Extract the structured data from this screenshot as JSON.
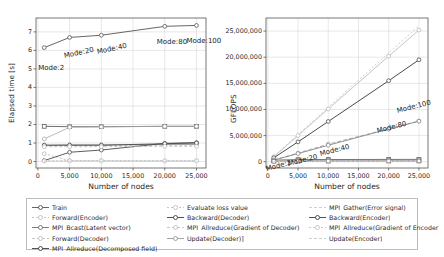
{
  "figure": {
    "background": "#ffffff",
    "frame_color": "#555555",
    "grid_color": "#d9d9d9"
  },
  "chart_data": [
    {
      "type": "line",
      "panel": "left",
      "title": "",
      "xlabel": "Number of nodes",
      "ylabel": "Elapsed time [s]",
      "xlim": [
        -300,
        26500
      ],
      "ylim": [
        -0.35,
        7.75
      ],
      "xticks": [
        0,
        5000,
        10000,
        15000,
        20000,
        25000
      ],
      "xticklabels": [
        "0",
        "5,000",
        "10,000",
        "15,000",
        "20,000",
        "25,000"
      ],
      "yticks": [
        0,
        1,
        2,
        3,
        4,
        5,
        6,
        7
      ],
      "yticklabels": [
        "0",
        "1",
        "2",
        "3",
        "4",
        "5",
        "6",
        "7"
      ],
      "grid": true,
      "legend_position": "below-figure",
      "x": [
        1000,
        5000,
        10000,
        20000,
        25000
      ],
      "annotations": [
        {
          "text": "Mode:2",
          "x": 1000,
          "y": 6.15,
          "dx": -6,
          "dy": 16,
          "rotation": 0
        },
        {
          "text": "Mode:20",
          "x": 5000,
          "y": 6.7,
          "dx": -6,
          "dy": 15,
          "rotation": -12
        },
        {
          "text": "Mode:40",
          "x": 10000,
          "y": 6.8,
          "dx": -4,
          "dy": 12,
          "rotation": -12
        },
        {
          "text": "Mode:80",
          "x": 20000,
          "y": 7.3,
          "dx": -8,
          "dy": 12,
          "rotation": 0
        },
        {
          "text": "Mode:100",
          "x": 25000,
          "y": 7.35,
          "dx": -10,
          "dy": 12,
          "rotation": 0
        }
      ],
      "series": [
        {
          "name": "Train",
          "values": [
            6.15,
            6.7,
            6.82,
            7.3,
            7.35
          ],
          "color": "#555555",
          "dash": "none",
          "marker": "o",
          "width": 0.9
        },
        {
          "name": "Forward(Encoder)",
          "values": [
            0.42,
            0.05,
            0.05,
            0.04,
            0.04
          ],
          "color": "#b5b5b5",
          "dash": "2,2",
          "marker": "o",
          "width": 0.8
        },
        {
          "name": "MPI_Bcast(Latent vector)",
          "values": [
            0.88,
            0.9,
            0.9,
            0.92,
            0.92
          ],
          "color": "#8a8a8a",
          "dash": "none",
          "marker": "o",
          "width": 0.8
        },
        {
          "name": "Forward(Decoder)",
          "values": [
            0.85,
            0.86,
            0.86,
            0.88,
            0.88
          ],
          "color": "#b5b5b5",
          "dash": "3,2",
          "marker": "o",
          "width": 0.8
        },
        {
          "name": "MPI_Allreduce(Decomposed field)",
          "values": [
            1.9,
            1.88,
            1.88,
            1.9,
            1.9
          ],
          "color": "#5d5d5d",
          "dash": "none",
          "marker": "s",
          "width": 0.9
        },
        {
          "name": "Evaluate loss value",
          "values": [
            0.04,
            0.04,
            0.04,
            0.04,
            0.04
          ],
          "color": "#c2c2c2",
          "dash": "2,2",
          "marker": "o",
          "width": 0.8
        },
        {
          "name": "Backward(Decoder)",
          "values": [
            0.05,
            0.5,
            0.62,
            0.98,
            1.02
          ],
          "color": "#4a4a4a",
          "dash": "none",
          "marker": "o",
          "width": 0.9
        },
        {
          "name": "MPI_Allreduce(Gradient of Decoder)",
          "values": [
            1.22,
            1.85,
            1.87,
            1.9,
            1.9
          ],
          "color": "#a8a8a8",
          "dash": "none",
          "marker": "o",
          "width": 0.8
        },
        {
          "name": "Update(Decoder)]",
          "values": [
            0.03,
            0.03,
            0.03,
            0.03,
            0.03
          ],
          "color": "#c9c9c9",
          "dash": "2,2",
          "marker": "o",
          "width": 0.8
        },
        {
          "name": "MPI_Gather(Error signal)",
          "values": [
            0.02,
            0.02,
            0.02,
            0.02,
            0.02
          ],
          "color": "#cfcfcf",
          "dash": "none",
          "marker": "none",
          "width": 0.7
        },
        {
          "name": "Backward(Encoder)",
          "values": [
            0.88,
            0.88,
            0.88,
            0.96,
            1.0
          ],
          "color": "#4a4a4a",
          "dash": "none",
          "marker": "o",
          "width": 0.9
        },
        {
          "name": "MPI_Allreduce(Gradient of Encoder)",
          "values": [
            0.8,
            0.8,
            0.8,
            0.82,
            0.82
          ],
          "color": "#bbbbbb",
          "dash": "3,2",
          "marker": "o",
          "width": 0.8
        },
        {
          "name": "Update(Encoder)",
          "values": [
            0.01,
            0.01,
            0.01,
            0.01,
            0.01
          ],
          "color": "#d2d2d2",
          "dash": "2,2",
          "marker": "none",
          "width": 0.7
        }
      ]
    },
    {
      "type": "line",
      "panel": "right",
      "title": "",
      "xlabel": "Number of nodes",
      "ylabel": "GFLOPS",
      "xlim": [
        -300,
        26500
      ],
      "ylim": [
        -1200000,
        27500000
      ],
      "xticks": [
        0,
        5000,
        10000,
        15000,
        20000,
        25000
      ],
      "xticklabels": [
        "0",
        "5,000",
        "10,000",
        "15,000",
        "20,000",
        "25,000"
      ],
      "yticks": [
        0,
        5000000,
        10000000,
        15000000,
        20000000,
        25000000
      ],
      "yticklabels": [
        "0",
        "5,000,000",
        "10,000,000",
        "15,000,000",
        "20,000,000",
        "25,000,000"
      ],
      "grid": true,
      "legend_position": "below-figure",
      "x": [
        1000,
        5000,
        10000,
        20000,
        25000
      ],
      "annotations": [
        {
          "text": "Mode:2",
          "x": 1000,
          "y": 600000,
          "dx": -8,
          "dy": 6,
          "rotation": -14
        },
        {
          "text": "Mode:20",
          "x": 5000,
          "y": 1800000,
          "dx": -10,
          "dy": 8,
          "rotation": -14
        },
        {
          "text": "Mode:40",
          "x": 10000,
          "y": 3400000,
          "dx": -8,
          "dy": 6,
          "rotation": -14
        },
        {
          "text": "Mode:80",
          "x": 20000,
          "y": 6300000,
          "dx": -12,
          "dy": -2,
          "rotation": -14
        },
        {
          "text": "Mode:100",
          "x": 25000,
          "y": 7800000,
          "dx": -22,
          "dy": -14,
          "rotation": -14
        }
      ],
      "series": [
        {
          "name": "Train",
          "values": [
            300000,
            400000,
            420000,
            440000,
            450000
          ],
          "color": "#5d5d5d",
          "dash": "none",
          "marker": "s",
          "width": 0.9
        },
        {
          "name": "Forward(Encoder)",
          "values": [
            1000000,
            5200000,
            10400000,
            20800000,
            26000000
          ],
          "color": "#cacaca",
          "dash": "2,2",
          "marker": "none",
          "width": 0.9
        },
        {
          "name": "MPI_Bcast(Latent vector)",
          "values": [
            950000,
            5000000,
            10100000,
            20200000,
            25200000
          ],
          "color": "#bcbcbc",
          "dash": "none",
          "marker": "o",
          "width": 0.9
        },
        {
          "name": "Forward(Decoder)",
          "values": [
            760000,
            3800000,
            7700000,
            15500000,
            19500000
          ],
          "color": "#4a4a4a",
          "dash": "none",
          "marker": "o",
          "width": 1.0
        },
        {
          "name": "MPI_Allreduce(Decomposed field)",
          "values": [
            200000,
            250000,
            280000,
            300000,
            320000
          ],
          "color": "#8f8f8f",
          "dash": "none",
          "marker": "s",
          "width": 0.8
        },
        {
          "name": "Evaluate loss value",
          "values": [
            330000,
            1650000,
            3350000,
            6300000,
            7800000
          ],
          "color": "#a0a0a0",
          "dash": "4,2",
          "marker": "o",
          "width": 0.9
        },
        {
          "name": "Backward(Decoder)",
          "values": [
            310000,
            1560000,
            3150000,
            6250000,
            7750000
          ],
          "color": "#8a8a8a",
          "dash": "none",
          "marker": "o",
          "width": 0.9
        },
        {
          "name": "MPI_Allreduce(Gradient of Decoder)",
          "values": [
            150000,
            180000,
            200000,
            220000,
            230000
          ],
          "color": "#c4c4c4",
          "dash": "none",
          "marker": "none",
          "width": 0.7
        },
        {
          "name": "Update(Decoder)]",
          "values": [
            120000,
            150000,
            160000,
            170000,
            180000
          ],
          "color": "#cccccc",
          "dash": "2,2",
          "marker": "none",
          "width": 0.7
        },
        {
          "name": "MPI_Gather(Error signal)",
          "values": [
            100000,
            120000,
            130000,
            140000,
            150000
          ],
          "color": "#d4d4d4",
          "dash": "none",
          "marker": "none",
          "width": 0.7
        },
        {
          "name": "Backward(Encoder)",
          "values": [
            90000,
            110000,
            120000,
            130000,
            140000
          ],
          "color": "#6e6e6e",
          "dash": "none",
          "marker": "s",
          "width": 0.8
        },
        {
          "name": "MPI_Allreduce(Gradient of Encoder)",
          "values": [
            80000,
            100000,
            110000,
            120000,
            130000
          ],
          "color": "#cfcfcf",
          "dash": "3,2",
          "marker": "none",
          "width": 0.7
        },
        {
          "name": "Update(Encoder)",
          "values": [
            70000,
            90000,
            100000,
            110000,
            120000
          ],
          "color": "#d8d8d8",
          "dash": "2,2",
          "marker": "none",
          "width": 0.7
        }
      ]
    }
  ],
  "legend": {
    "columns": [
      [
        {
          "label": "Train",
          "color": "#555555",
          "dash": "none",
          "marker": "o"
        },
        {
          "label": "Forward(Encoder)",
          "color": "#bdbdbd",
          "dash": "2,2",
          "marker": "o"
        },
        {
          "label": "MPI_Bcast(Latent vector)",
          "color": "#6f6f6f",
          "dash": "none",
          "marker": "o"
        },
        {
          "label": "Forward(Decoder)",
          "color": "#bdbdbd",
          "dash": "3,2",
          "marker": "o"
        },
        {
          "label": "MPI_Allreduce(Decomposed field)",
          "color": "#3d3d3d",
          "dash": "none",
          "marker": "o"
        }
      ],
      [
        {
          "label": "Evaluate loss value",
          "color": "#c0c0c0",
          "dash": "2,2",
          "marker": "o"
        },
        {
          "label": "Backward(Decoder)",
          "color": "#3d3d3d",
          "dash": "none",
          "marker": "o"
        },
        {
          "label": "MPI_Allreduce(Gradient of Decoder)",
          "color": "#c0c0c0",
          "dash": "3,2",
          "marker": "o"
        },
        {
          "label": "Update(Decoder)]",
          "color": "#9a9a9a",
          "dash": "none",
          "marker": "o"
        }
      ],
      [
        {
          "label": "MPI_Gather(Error signal)",
          "color": "#cacaca",
          "dash": "3,2",
          "marker": "none"
        },
        {
          "label": "Backward(Encoder)",
          "color": "#3d3d3d",
          "dash": "none",
          "marker": "o"
        },
        {
          "label": "MPI_Allreduce(Gradient of Encoder)",
          "color": "#c0c0c0",
          "dash": "2,2",
          "marker": "o"
        },
        {
          "label": "Update(Encoder)",
          "color": "#cacaca",
          "dash": "3,2",
          "marker": "none"
        }
      ]
    ]
  }
}
